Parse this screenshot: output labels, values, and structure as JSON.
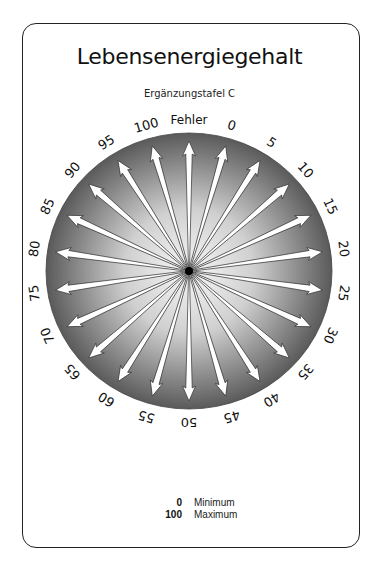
{
  "title": "Lebensenergiegehalt",
  "subtitle": "Ergänzungstafel C",
  "dial": {
    "center": [
      189,
      271
    ],
    "radius": 140,
    "colors": {
      "center": "#f7f7f7",
      "rim": "#5a5a5a",
      "arrow": "#ffffff",
      "arrow_stroke": "#333333"
    },
    "labels": [
      "Fehler",
      "0",
      "5",
      "10",
      "15",
      "20",
      "25",
      "30",
      "35",
      "40",
      "45",
      "50",
      "55",
      "60",
      "65",
      "70",
      "75",
      "80",
      "85",
      "90",
      "95",
      "100"
    ]
  },
  "legend": [
    {
      "value": "0",
      "label": "Minimum"
    },
    {
      "value": "100",
      "label": "Maximum"
    }
  ]
}
